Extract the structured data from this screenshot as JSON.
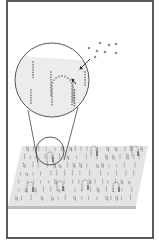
{
  "figure": {
    "width": 159,
    "height": 245,
    "background": "#ffffff",
    "frame": {
      "x": 7,
      "y": 1,
      "w": 146,
      "h": 237,
      "stroke": "#333333",
      "stroke_width": 1.6
    },
    "surface": {
      "points": [
        [
          22,
          146
        ],
        [
          148,
          146
        ],
        [
          136,
          206
        ],
        [
          8,
          206
        ]
      ],
      "fill": "#e4e4e4",
      "edge": {
        "points": [
          [
            8,
            206
          ],
          [
            136,
            206
          ],
          [
            136,
            209
          ],
          [
            8,
            209
          ]
        ],
        "fill": "#bdbdbd"
      },
      "probe_color": "#8a8a8a",
      "hairpin_color": "#7a7a7a",
      "hairpins": [
        [
          50,
          155
        ],
        [
          94,
          149
        ],
        [
          135,
          149
        ],
        [
          30,
          185
        ],
        [
          60,
          184
        ],
        [
          85,
          183
        ],
        [
          116,
          185
        ]
      ]
    },
    "magnifier": {
      "large_circle": {
        "cx": 52,
        "cy": 80,
        "r": 37,
        "fill": "#ececec",
        "stroke": "#444444"
      },
      "small_circle": {
        "cx": 50,
        "cy": 151,
        "r": 14,
        "stroke": "#444444"
      },
      "connector_lines": [
        [
          [
            28,
            110
          ],
          [
            38,
            163
          ]
        ],
        [
          [
            78,
            107
          ],
          [
            64,
            160
          ]
        ]
      ],
      "dot_color": "#8c8c8c",
      "columns": [
        {
          "x": 33,
          "y0": 62,
          "count": 7
        },
        {
          "x": 31,
          "y0": 90,
          "count": 6
        },
        {
          "x": 51,
          "y0": 72,
          "count": 10
        },
        {
          "x": 73,
          "y0": 80,
          "count": 9
        },
        {
          "x": 85,
          "y0": 72,
          "count": 6
        }
      ],
      "hairpin": {
        "cx": 62,
        "cy": 86,
        "r": 10,
        "leg_bottom": 106
      },
      "arrows": [
        {
          "from": [
            90,
            59
          ],
          "to": [
            80,
            69
          ]
        },
        {
          "from": [
            76,
            84
          ],
          "to": [
            72,
            79
          ]
        }
      ]
    },
    "free_molecules": {
      "color": "#8c8c8c",
      "dots": [
        [
          89,
          48
        ],
        [
          100,
          43
        ],
        [
          109,
          45
        ],
        [
          116,
          44
        ],
        [
          97,
          51
        ],
        [
          105,
          52
        ],
        [
          116,
          53
        ],
        [
          95,
          57
        ]
      ]
    }
  }
}
